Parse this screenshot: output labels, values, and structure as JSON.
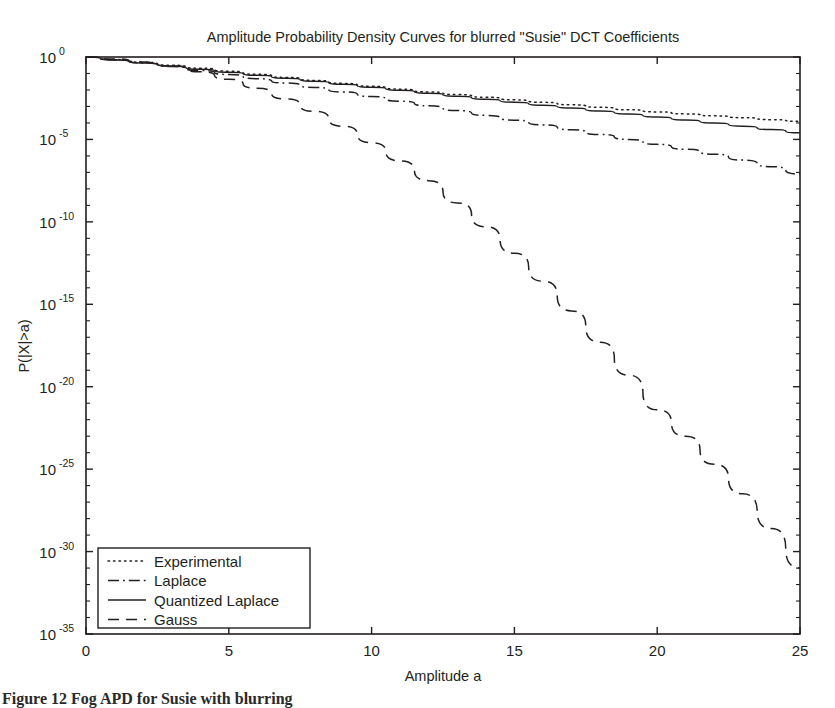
{
  "figure": {
    "width": 835,
    "height": 708,
    "background": "#ffffff",
    "ink_color": "#231f20"
  },
  "caption": {
    "text": "Figure 12 Fog APD for Susie with blurring"
  },
  "chart_data": {
    "type": "line",
    "title": "Amplitude Probability Density Curves for blurred \"Susie\" DCT Coefficients",
    "xlabel": "Amplitude a",
    "ylabel": "P(|X|>a)",
    "xscale": "linear",
    "yscale": "log",
    "xlim": [
      0,
      25
    ],
    "ylim": [
      1e-35,
      1
    ],
    "grid": false,
    "legend_position": "lower left",
    "x_ticks": [
      0,
      5,
      10,
      15,
      20,
      25
    ],
    "x_tick_labels": [
      "0",
      "5",
      "10",
      "15",
      "20",
      "25"
    ],
    "y_ticks": [
      0,
      -5,
      -10,
      -15,
      -20,
      -25,
      -30,
      -35
    ],
    "y_tick_labels": [
      {
        "mantissa": "10",
        "exponent": "0"
      },
      {
        "mantissa": "10",
        "exponent": "-5"
      },
      {
        "mantissa": "10",
        "exponent": "-10"
      },
      {
        "mantissa": "10",
        "exponent": "-15"
      },
      {
        "mantissa": "10",
        "exponent": "-20"
      },
      {
        "mantissa": "10",
        "exponent": "-25"
      },
      {
        "mantissa": "10",
        "exponent": "-30"
      },
      {
        "mantissa": "10",
        "exponent": "-35"
      }
    ],
    "y_minor_decades": 1,
    "x": [
      0,
      1,
      2,
      3,
      4,
      5,
      6,
      7,
      8,
      9,
      10,
      11,
      12,
      13,
      14,
      15,
      16,
      17,
      18,
      19,
      20,
      21,
      22,
      23,
      24,
      25
    ],
    "series": [
      {
        "name": "Experimental",
        "style": "dotted",
        "dash": "1.5,4",
        "log10_values": [
          0,
          -0.15,
          -0.32,
          -0.5,
          -0.68,
          -0.86,
          -1.05,
          -1.24,
          -1.42,
          -1.6,
          -1.78,
          -1.95,
          -2.12,
          -2.28,
          -2.44,
          -2.6,
          -2.75,
          -2.9,
          -3.05,
          -3.2,
          -3.33,
          -3.45,
          -3.57,
          -3.68,
          -3.8,
          -3.9
        ]
      },
      {
        "name": "Laplace",
        "style": "dash-dot",
        "dash": "11,4,1.8,4",
        "log10_values": [
          0,
          -0.17,
          -0.36,
          -0.58,
          -0.82,
          -1.06,
          -1.32,
          -1.58,
          -1.85,
          -2.12,
          -2.4,
          -2.68,
          -2.96,
          -3.25,
          -3.54,
          -3.83,
          -4.12,
          -4.41,
          -4.7,
          -5.0,
          -5.3,
          -5.6,
          -5.9,
          -6.25,
          -6.65,
          -7.1
        ]
      },
      {
        "name": "Quantized Laplace",
        "style": "solid",
        "dash": "none",
        "log10_values": [
          0,
          -0.18,
          -0.36,
          -0.55,
          -0.74,
          -0.92,
          -1.11,
          -1.29,
          -1.47,
          -1.66,
          -1.84,
          -2.02,
          -2.2,
          -2.38,
          -2.56,
          -2.74,
          -2.92,
          -3.1,
          -3.28,
          -3.46,
          -3.64,
          -3.82,
          -4.0,
          -4.2,
          -4.4,
          -4.6
        ]
      },
      {
        "name": "Gauss",
        "style": "dashed",
        "dash": "11,7",
        "log10_values": [
          0,
          -0.12,
          -0.3,
          -0.55,
          -0.9,
          -1.35,
          -1.9,
          -2.55,
          -3.3,
          -4.2,
          -5.2,
          -6.3,
          -7.5,
          -8.85,
          -10.3,
          -11.9,
          -13.6,
          -15.4,
          -17.3,
          -19.3,
          -21.4,
          -23.0,
          -24.7,
          -26.5,
          -28.6,
          -31.0
        ]
      }
    ]
  },
  "legend": {
    "items": [
      {
        "label": "Experimental"
      },
      {
        "label": "Laplace"
      },
      {
        "label": "Quantized Laplace"
      },
      {
        "label": "Gauss"
      }
    ]
  }
}
